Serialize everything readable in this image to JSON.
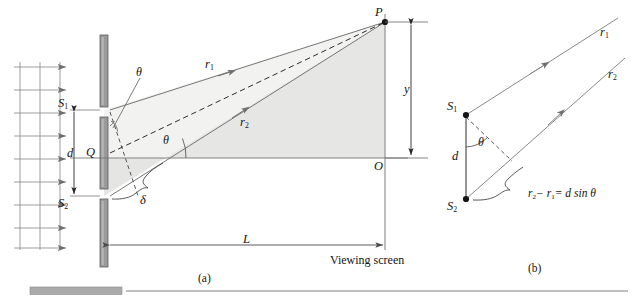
{
  "figure": {
    "type": "physics-diagram",
    "topic": "Young's double-slit interference geometry",
    "panels": [
      {
        "id": "a",
        "caption": "(a)"
      },
      {
        "id": "b",
        "caption": "(b)"
      }
    ]
  },
  "panel_a": {
    "caption": "(a)",
    "labels": {
      "slit_1": "S",
      "slit_1_sub": "1",
      "slit_2": "S",
      "slit_2_sub": "2",
      "midpoint": "Q",
      "origin": "O",
      "point_P": "P",
      "slit_separation": "d",
      "ray_1": "r",
      "ray_1_sub": "1",
      "ray_2": "r",
      "ray_2_sub": "2",
      "angle_upper": "θ",
      "angle_lower": "θ",
      "path_difference": "δ",
      "screen_distance": "L",
      "transverse_position": "y",
      "screen_name": "Viewing screen"
    },
    "geometry": {
      "barrier_x": 104,
      "slit_1_y": 110,
      "slit_2_y": 196,
      "midpoint_Q_y": 153,
      "point_P_x": 385,
      "point_P_y": 22,
      "origin_O_x": 385,
      "origin_O_y": 158,
      "screen_x": 385,
      "wavefront_count": 3,
      "wave_arrow_count": 9
    }
  },
  "panel_b": {
    "caption": "(b)",
    "labels": {
      "slit_1": "S",
      "slit_1_sub": "1",
      "slit_2": "S",
      "slit_2_sub": "2",
      "slit_separation": "d",
      "angle": "θ",
      "ray_1": "r",
      "ray_1_sub": "1",
      "ray_2": "r",
      "ray_2_sub": "2",
      "path_difference_equation_lhs_r2": "r",
      "path_difference_equation": "− r",
      "path_difference_equation_rhs": "= d sin θ"
    },
    "geometry": {
      "slit_1_x": 466,
      "slit_1_y": 115,
      "slit_2_x": 466,
      "slit_2_y": 199
    }
  },
  "colors": {
    "line": "#6f6f6f",
    "line_dark": "#3c3c3c",
    "text": "#141414",
    "barrier_fill": "#9a9a9a",
    "barrier_stroke": "#606060",
    "shaded_region": "#e3e3e1",
    "rule": "#707070",
    "swatch": "#a8a8a8"
  }
}
